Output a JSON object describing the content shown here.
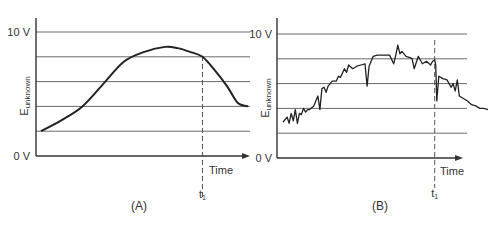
{
  "chart_data": [
    {
      "type": "line",
      "panel_label": "(A)",
      "ylabel": "E",
      "ylabel_subscript": "unknown",
      "xlabel": "Time",
      "y_tick_labels": [
        "0 V",
        "10 V"
      ],
      "ylim": [
        0,
        10
      ],
      "xlim": [
        0,
        1
      ],
      "gridlines_y": [
        2,
        4,
        6,
        8,
        10
      ],
      "marker": {
        "label": "t",
        "subscript": "1",
        "x": 0.78
      },
      "series": [
        {
          "name": "smooth signal",
          "x": [
            0.0,
            0.1,
            0.2,
            0.3,
            0.4,
            0.5,
            0.6,
            0.66,
            0.72,
            0.78,
            0.84,
            0.9,
            0.95,
            1.0
          ],
          "y": [
            2.0,
            2.9,
            4.0,
            5.8,
            7.6,
            8.4,
            8.8,
            8.7,
            8.4,
            8.0,
            6.9,
            5.6,
            4.3,
            4.0
          ]
        }
      ]
    },
    {
      "type": "line",
      "panel_label": "(B)",
      "ylabel": "E",
      "ylabel_subscript": "unknown",
      "xlabel": "Time",
      "y_tick_labels": [
        "0 V",
        "10 V"
      ],
      "ylim": [
        0,
        10
      ],
      "xlim": [
        0,
        1
      ],
      "gridlines_y": [
        2,
        4,
        6,
        8,
        10
      ],
      "marker": {
        "label": "t",
        "subscript": "1",
        "x": 0.74
      },
      "series": [
        {
          "name": "noisy signal",
          "x": [
            0.0,
            0.02,
            0.03,
            0.04,
            0.05,
            0.06,
            0.07,
            0.08,
            0.09,
            0.1,
            0.11,
            0.12,
            0.13,
            0.15,
            0.17,
            0.18,
            0.19,
            0.2,
            0.21,
            0.22,
            0.24,
            0.26,
            0.27,
            0.28,
            0.3,
            0.31,
            0.32,
            0.34,
            0.36,
            0.38,
            0.4,
            0.41,
            0.42,
            0.44,
            0.46,
            0.48,
            0.5,
            0.52,
            0.54,
            0.55,
            0.56,
            0.57,
            0.58,
            0.6,
            0.62,
            0.63,
            0.64,
            0.66,
            0.68,
            0.7,
            0.72,
            0.73,
            0.74,
            0.745,
            0.75,
            0.76,
            0.78,
            0.8,
            0.82,
            0.83,
            0.84,
            0.85,
            0.86,
            0.88,
            0.9,
            0.92,
            0.94,
            0.96,
            0.98,
            1.0
          ],
          "y": [
            2.9,
            3.3,
            2.8,
            3.6,
            3.0,
            3.9,
            2.8,
            3.6,
            3.5,
            4.0,
            3.7,
            3.9,
            3.9,
            4.2,
            5.0,
            3.9,
            5.6,
            5.7,
            5.3,
            5.8,
            6.2,
            6.2,
            6.6,
            6.5,
            7.2,
            6.9,
            7.5,
            7.2,
            7.4,
            7.5,
            7.6,
            5.8,
            7.4,
            8.2,
            8.3,
            8.3,
            8.3,
            8.3,
            7.6,
            8.3,
            9.1,
            8.4,
            8.6,
            8.2,
            8.1,
            8.0,
            7.2,
            8.2,
            7.6,
            7.8,
            7.5,
            7.8,
            7.9,
            7.5,
            4.6,
            6.6,
            6.4,
            6.3,
            5.7,
            6.0,
            5.4,
            6.3,
            5.0,
            4.8,
            4.6,
            4.3,
            4.2,
            4.0,
            4.0,
            3.9
          ]
        }
      ]
    }
  ]
}
